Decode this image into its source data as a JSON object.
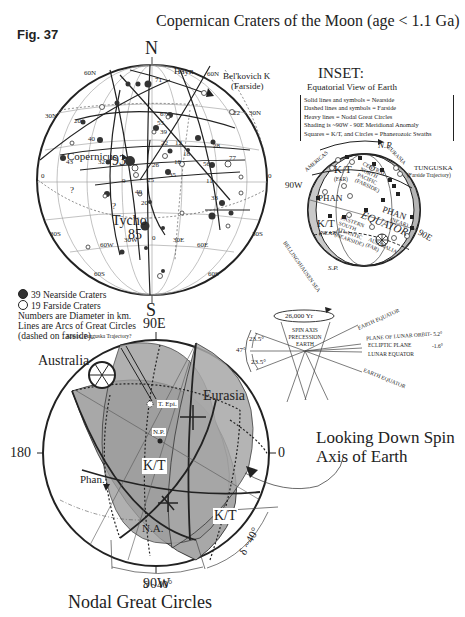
{
  "figure": {
    "label": "Fig. 37",
    "title": "Copernican Craters of the Moon (age < 1.1 Ga)"
  },
  "moon_map": {
    "north_label": "N",
    "south_label": "S",
    "lat_labels": [
      "60N",
      "30N",
      "0",
      "30S",
      "60S",
      "60N",
      "30N",
      "0",
      "30S",
      "60S"
    ],
    "lon_labels": [
      "60W",
      "30W",
      "0",
      "30E",
      "60E"
    ],
    "named_craters": [
      {
        "name": "Copernicus",
        "diameter": "93"
      },
      {
        "name": "Tycho",
        "diameter": "85"
      },
      {
        "name": "Hayn",
        "diameter": ""
      },
      {
        "name": "Bel'kovich K",
        "note": "(Farside)"
      }
    ],
    "crater_diameters": [
      "71",
      "67",
      "55",
      "39",
      "22",
      "12",
      "28",
      "18",
      "18",
      "77",
      "56",
      "35",
      "26",
      "25",
      "40",
      "11",
      "33",
      "20",
      "43",
      "40",
      "32",
      "9",
      "20",
      "22"
    ],
    "unknown_marks": [
      "?",
      "?"
    ]
  },
  "legend": {
    "nearside": "39 Nearside Craters",
    "farside": "19 Farside Craters",
    "note1": "Numbers are Diameter in km.",
    "note2": "Lines are Arcs of Great Circles",
    "note3": "(dashed on farside)."
  },
  "inset": {
    "title": "INSET:",
    "subtitle": "Equatorial View of Earth",
    "key": [
      "Solid lines and symbols = Nearside",
      "Dashed lines and symbols = Farside",
      "Heavy lines = Nodal Great Circles",
      "Shading is ~90W - 90E Meridional Anomaly",
      "Squares = K/T, and Circles = Phanerozoic Swaths"
    ],
    "labels": {
      "np": "N.P.",
      "eurasia": "EURASIA",
      "americas": "AMERICAS",
      "tunguska": "TUNGUSKA",
      "tunguska_note": "(Farside Trajectory)",
      "w90": "90W",
      "e90": "90E",
      "kt_far": "K/T",
      "kt_far_sub": "(FAR)",
      "kt_near": "K/T",
      "kt_near_sub": "(NEAR)",
      "phan": "PHAN",
      "phan_near": "(NEAR)",
      "phan_far": "PHAN",
      "central_pacific": [
        "CENTRAL",
        "NORTH",
        "PACIFIC",
        "(FARSIDE)"
      ],
      "equator": "EQUATOR",
      "eastern_atlantic": [
        "EASTERN",
        "SOUTH",
        "ATLANTIC",
        "(NEARSIDE)"
      ],
      "australia": [
        "AUSTRALIA",
        "(FAR)"
      ],
      "bellingshausen": "BELLINGSHAUSEN SEA",
      "sp": "S.P."
    }
  },
  "precession": {
    "period": "26,000 Yr",
    "cone_label": [
      "SPIN AXIS",
      "PRECESSION",
      "EARTH"
    ],
    "angle_top": "23.5°",
    "angle_bottom": "23.5°",
    "angle_total": "47°",
    "lines": {
      "earth_equator_top": "EARTH EQUATOR",
      "lunar_orbit": "PLANE OF LUNAR ORBIT",
      "lunar_orbit_angle": "- 5.2°",
      "ecliptic": "ECLIPTIC PLANE",
      "ecliptic_angle": "-1.6°",
      "lunar_equator": "LUNAR EQUATOR",
      "earth_equator_bottom": "EARTH EQUATOR"
    }
  },
  "nodal_map": {
    "top_label": "90E",
    "bottom_label": "90W",
    "left_label": "180",
    "right_label": "0",
    "tunguska_note": "Appox. Tunguska Trajectory?",
    "australia": "Australia",
    "eurasia": "Eurasia",
    "tunguska_epi": "T. Epi.",
    "north_pole": "N.P.",
    "kt_center": "K/T",
    "kt_right": "K/T",
    "phan": "Phan.",
    "na": "N.A.",
    "delta_bottom": "δ ~40°",
    "delta_right": "δ ~40°",
    "looking_line1": "Looking Down Spin",
    "looking_line2": "Axis of Earth",
    "title": "Nodal Great Circles"
  },
  "colors": {
    "ink": "#222222",
    "grid": "#888888",
    "shade": "#a8a8a8"
  }
}
